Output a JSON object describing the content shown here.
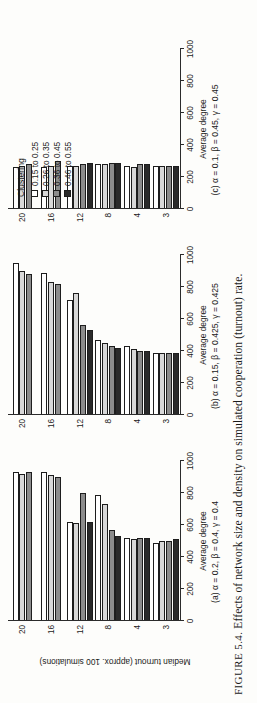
{
  "figure": {
    "number": "FIGURE 5.4.",
    "caption": "Effects of network size and density on simulated cooperation (turnout) rate."
  },
  "legend": {
    "title": "Clustering",
    "items": [
      {
        "label": "0.15 to 0.25",
        "color": "#ffffff"
      },
      {
        "label": "0.26 to 0.35",
        "color": "#d8d8d8"
      },
      {
        "label": "0.36 to 0.45",
        "color": "#8c8c8c"
      },
      {
        "label": "0.46 to 0.55",
        "color": "#2a2a2a"
      }
    ]
  },
  "axes": {
    "ylabel": "Median turnout (approx. 100 simulations)",
    "xlabel": "Average degree",
    "ticks": [
      "0",
      "200",
      "400",
      "600",
      "800",
      "1000"
    ]
  },
  "chart_data": [
    {
      "type": "bar",
      "id": "panel-a",
      "title": "(a)  α = 0.2, β = 0.4, γ = 0.4",
      "xlabel": "Average degree",
      "ylabel": "Median turnout (approx. 100 simulations)",
      "ylim": [
        0,
        1000
      ],
      "grid": false,
      "orientation": "horizontal",
      "categories": [
        "3",
        "4",
        "8",
        "12",
        "16",
        "20"
      ],
      "series": [
        {
          "name": "0.15 to 0.25",
          "color": "#ffffff",
          "values": [
            490,
            520,
            790,
            620,
            930,
            930
          ]
        },
        {
          "name": "0.26 to 0.35",
          "color": "#d8d8d8",
          "values": [
            500,
            510,
            730,
            610,
            910,
            920
          ]
        },
        {
          "name": "0.36 to 0.45",
          "color": "#8c8c8c",
          "values": [
            500,
            520,
            570,
            800,
            900,
            930
          ]
        },
        {
          "name": "0.46 to 0.55",
          "color": "#2a2a2a",
          "values": [
            510,
            520,
            530,
            620,
            null,
            null
          ]
        }
      ]
    },
    {
      "type": "bar",
      "id": "panel-b",
      "title": "(b)  α = 0.15, β = 0.425, γ = 0.425",
      "xlabel": "Average degree",
      "ylabel": "Median turnout (approx. 100 simulations)",
      "ylim": [
        0,
        1000
      ],
      "grid": false,
      "orientation": "horizontal",
      "categories": [
        "3",
        "4",
        "8",
        "12",
        "16",
        "20"
      ],
      "series": [
        {
          "name": "0.15 to 0.25",
          "color": "#ffffff",
          "values": [
            390,
            430,
            470,
            720,
            890,
            950
          ]
        },
        {
          "name": "0.26 to 0.35",
          "color": "#d8d8d8",
          "values": [
            390,
            410,
            450,
            760,
            830,
            900
          ]
        },
        {
          "name": "0.36 to 0.45",
          "color": "#8c8c8c",
          "values": [
            390,
            400,
            430,
            560,
            820,
            880
          ]
        },
        {
          "name": "0.46 to 0.55",
          "color": "#2a2a2a",
          "values": [
            390,
            400,
            420,
            530,
            null,
            null
          ]
        }
      ]
    },
    {
      "type": "bar",
      "id": "panel-c",
      "title": "(c)  α = 0.1, β = 0.45, γ = 0.45",
      "xlabel": "Average degree",
      "ylabel": "Median turnout (approx. 100 simulations)",
      "ylim": [
        0,
        1000
      ],
      "grid": false,
      "orientation": "horizontal",
      "categories": [
        "3",
        "4",
        "8",
        "12",
        "16",
        "20"
      ],
      "series": [
        {
          "name": "0.15 to 0.25",
          "color": "#ffffff",
          "values": [
            270,
            270,
            280,
            270,
            260,
            260
          ]
        },
        {
          "name": "0.26 to 0.35",
          "color": "#d8d8d8",
          "values": [
            270,
            260,
            280,
            270,
            270,
            270
          ]
        },
        {
          "name": "0.36 to 0.45",
          "color": "#8c8c8c",
          "values": [
            270,
            280,
            290,
            280,
            300,
            280
          ]
        },
        {
          "name": "0.46 to 0.55",
          "color": "#2a2a2a",
          "values": [
            270,
            280,
            290,
            290,
            null,
            null
          ]
        }
      ]
    }
  ]
}
